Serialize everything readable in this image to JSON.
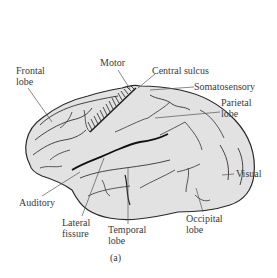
{
  "figure": {
    "caption": "(a)",
    "colors": {
      "brain_fill": "#e2e2e2",
      "outline": "#2a2a2a",
      "label_text": "#3a3a3a",
      "leader_line": "#555555"
    }
  },
  "labels": {
    "frontal": {
      "line1": "Frontal",
      "line2": "lobe"
    },
    "motor": "Motor",
    "central_sulcus": "Central sulcus",
    "somatosensory": "Somatosensory",
    "parietal": {
      "line1": "Parietal",
      "line2": "lobe"
    },
    "visual": "Visual",
    "occipital": {
      "line1": "Occipital",
      "line2": "lobe"
    },
    "temporal": {
      "line1": "Temporal",
      "line2": "lobe"
    },
    "lateral_fissure": {
      "line1": "Lateral",
      "line2": "fissure"
    },
    "auditory": "Auditory"
  }
}
